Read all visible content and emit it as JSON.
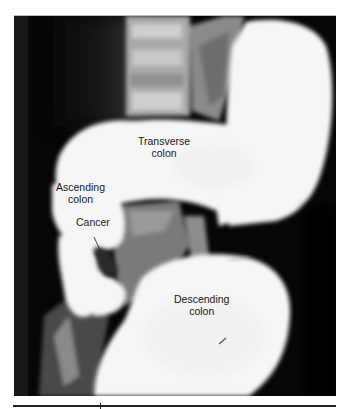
{
  "figure": {
    "type": "barium-enema-radiograph",
    "labels": {
      "transverse": [
        "Transverse",
        "colon"
      ],
      "ascending": [
        "Ascending",
        "colon"
      ],
      "cancer": "Cancer",
      "descending": [
        "Descending",
        "colon"
      ]
    }
  },
  "colors": {
    "background": "#050505",
    "barium": "#f7f7f7",
    "bone": "#bdbdbd",
    "label_text": "#1a1a1a"
  }
}
